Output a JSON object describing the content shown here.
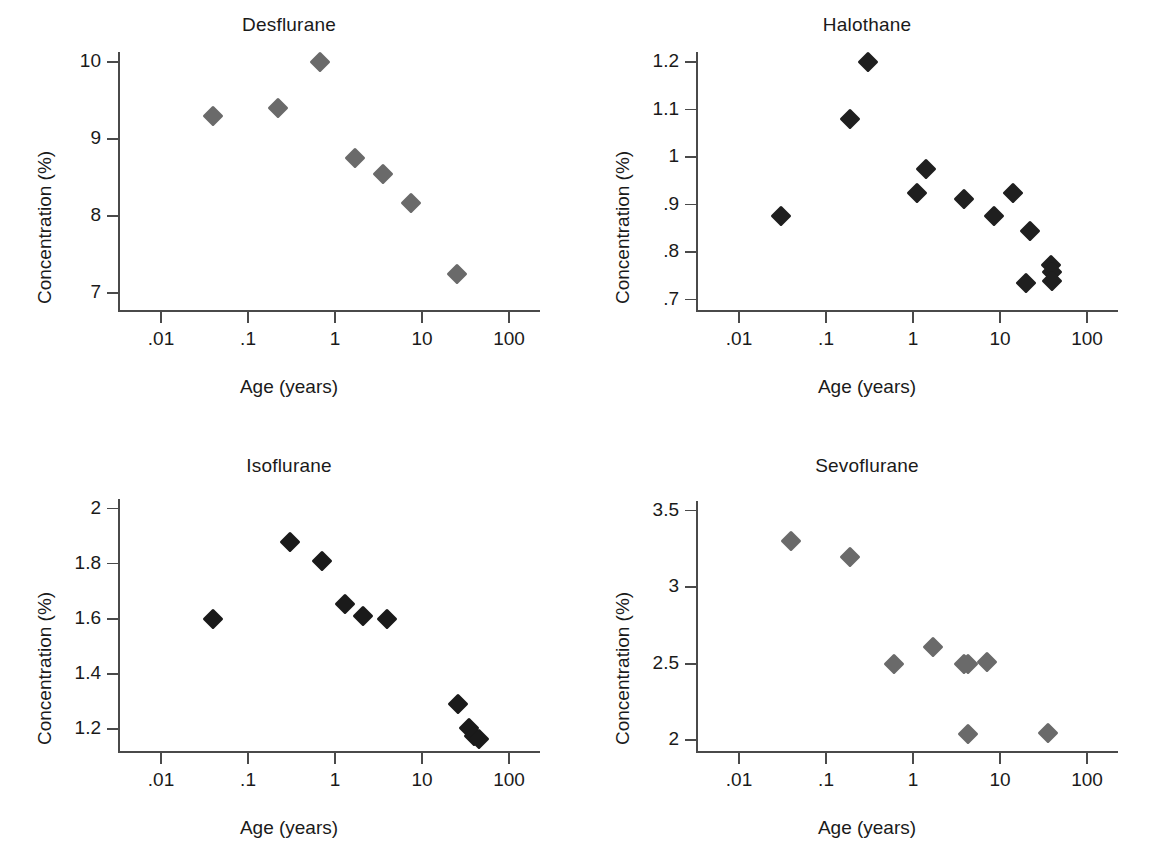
{
  "figure": {
    "layout": "2x2 grid of scatter plots",
    "shared_xlabel": "Age (years)",
    "shared_ylabel": "Concentration (%)",
    "x_tick_labels": [
      ".01",
      ".1",
      "1",
      "10",
      "100"
    ]
  },
  "chart_data": [
    {
      "type": "scatter",
      "title": "Desflurane",
      "xlabel": "Age (years)",
      "ylabel": "Concentration (%)",
      "xscale": "log",
      "xlim": [
        0.0032,
        215
      ],
      "x_ticks": [
        0.01,
        0.1,
        1,
        10,
        100
      ],
      "x_tick_labels": [
        ".01",
        ".1",
        "1",
        "10",
        "100"
      ],
      "ylim": [
        6.78,
        10.0
      ],
      "y_ticks": [
        7,
        8,
        9,
        10
      ],
      "y_tick_labels": [
        "7",
        "8",
        "9",
        "10"
      ],
      "grid": false,
      "legend": "none",
      "marker": "diamond",
      "marker_color": "#6a6a6a",
      "points": [
        {
          "age": 0.04,
          "conc": 9.3
        },
        {
          "age": 0.22,
          "conc": 9.4
        },
        {
          "age": 0.67,
          "conc": 10.0
        },
        {
          "age": 1.7,
          "conc": 8.75
        },
        {
          "age": 3.6,
          "conc": 8.55
        },
        {
          "age": 7.5,
          "conc": 8.17
        },
        {
          "age": 25.0,
          "conc": 7.25
        }
      ]
    },
    {
      "type": "scatter",
      "title": "Halothane",
      "xlabel": "Age (years)",
      "ylabel": "Concentration (%)",
      "xscale": "log",
      "xlim": [
        0.0032,
        215
      ],
      "x_ticks": [
        0.01,
        0.1,
        1,
        10,
        100
      ],
      "x_tick_labels": [
        ".01",
        ".1",
        "1",
        "10",
        "100"
      ],
      "ylim": [
        0.678,
        1.2
      ],
      "y_ticks": [
        0.7,
        0.8,
        0.9,
        1.0,
        1.1,
        1.2
      ],
      "y_tick_labels": [
        ".7",
        ".8",
        ".9",
        "1",
        "1.1",
        "1.2"
      ],
      "grid": false,
      "legend": "none",
      "marker": "diamond",
      "marker_color": "#1f1f1f",
      "points": [
        {
          "age": 0.03,
          "conc": 0.875
        },
        {
          "age": 0.19,
          "conc": 1.08
        },
        {
          "age": 0.3,
          "conc": 1.2
        },
        {
          "age": 1.1,
          "conc": 0.925
        },
        {
          "age": 1.4,
          "conc": 0.975
        },
        {
          "age": 3.8,
          "conc": 0.912
        },
        {
          "age": 8.5,
          "conc": 0.875
        },
        {
          "age": 14.0,
          "conc": 0.925
        },
        {
          "age": 22.0,
          "conc": 0.845
        },
        {
          "age": 20.0,
          "conc": 0.735
        },
        {
          "age": 38.0,
          "conc": 0.772
        },
        {
          "age": 40.0,
          "conc": 0.757
        },
        {
          "age": 40.0,
          "conc": 0.738
        }
      ]
    },
    {
      "type": "scatter",
      "title": "Isoflurane",
      "xlabel": "Age (years)",
      "ylabel": "Concentration (%)",
      "xscale": "log",
      "xlim": [
        0.0032,
        215
      ],
      "x_ticks": [
        0.01,
        0.1,
        1,
        10,
        100
      ],
      "x_tick_labels": [
        ".01",
        ".1",
        "1",
        "10",
        "100"
      ],
      "ylim": [
        1.12,
        2.02
      ],
      "y_ticks": [
        1.2,
        1.4,
        1.6,
        1.8,
        2.0
      ],
      "y_tick_labels": [
        "1.2",
        "1.4",
        "1.6",
        "1.8",
        "2"
      ],
      "grid": false,
      "legend": "none",
      "marker": "diamond",
      "marker_color": "#1a1a1a",
      "points": [
        {
          "age": 0.04,
          "conc": 1.6
        },
        {
          "age": 0.3,
          "conc": 1.88
        },
        {
          "age": 0.7,
          "conc": 1.81
        },
        {
          "age": 1.3,
          "conc": 1.655
        },
        {
          "age": 2.1,
          "conc": 1.61
        },
        {
          "age": 4.0,
          "conc": 1.6
        },
        {
          "age": 26.0,
          "conc": 1.29
        },
        {
          "age": 35.0,
          "conc": 1.205
        },
        {
          "age": 40.0,
          "conc": 1.175
        },
        {
          "age": 45.0,
          "conc": 1.165
        }
      ]
    },
    {
      "type": "scatter",
      "title": "Sevoflurane",
      "xlabel": "Age (years)",
      "ylabel": "Concentration (%)",
      "xscale": "log",
      "xlim": [
        0.0032,
        215
      ],
      "x_ticks": [
        0.01,
        0.1,
        1,
        10,
        100
      ],
      "x_tick_labels": [
        ".01",
        ".1",
        "1",
        "10",
        "100"
      ],
      "ylim": [
        1.93,
        3.55
      ],
      "y_ticks": [
        2.0,
        2.5,
        3.0,
        3.5
      ],
      "y_tick_labels": [
        "2",
        "2.5",
        "3",
        "3.5"
      ],
      "grid": false,
      "legend": "none",
      "marker": "diamond",
      "marker_color": "#6a6a6a",
      "points": [
        {
          "age": 0.04,
          "conc": 3.3
        },
        {
          "age": 0.19,
          "conc": 3.2
        },
        {
          "age": 0.6,
          "conc": 2.5
        },
        {
          "age": 1.7,
          "conc": 2.61
        },
        {
          "age": 3.9,
          "conc": 2.5
        },
        {
          "age": 4.3,
          "conc": 2.5
        },
        {
          "age": 7.0,
          "conc": 2.51
        },
        {
          "age": 4.3,
          "conc": 2.04
        },
        {
          "age": 36.0,
          "conc": 2.05
        }
      ]
    }
  ]
}
